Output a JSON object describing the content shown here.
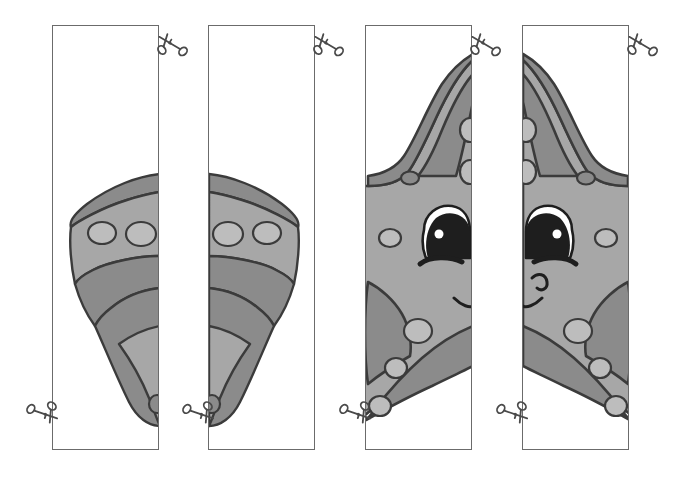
{
  "worksheet": {
    "title": "Starfish cut-and-match strips worksheet",
    "page_background": "#ffffff",
    "panel_count": 4,
    "panel_border_color": "#6b6b6b",
    "panel_fill": "#ffffff"
  },
  "colors": {
    "outline": "#3b3b3b",
    "body_light": "#a7a7a7",
    "body_dark": "#8b8b8b",
    "spot_light": "#bdbdbd",
    "eye_white": "#ffffff",
    "eye_dark": "#1e1e1e",
    "scissor": "#4a4a4a",
    "panel_border": "#6b6b6b"
  },
  "panels": [
    {
      "id": "panel-1",
      "name": "strip-1",
      "x": 52,
      "y": 25,
      "width": 107,
      "height": 425,
      "content": "starfish-arm-left-half",
      "scissors": [
        {
          "name": "scissors-top-right",
          "x": 155,
          "y": 28,
          "rotation": -18
        },
        {
          "name": "scissors-bottom-left",
          "x": 26,
          "y": 396,
          "rotation": 150
        }
      ]
    },
    {
      "id": "panel-2",
      "name": "strip-2",
      "x": 208,
      "y": 25,
      "width": 107,
      "height": 425,
      "content": "starfish-arm-right-half",
      "scissors": [
        {
          "name": "scissors-top-right",
          "x": 311,
          "y": 28,
          "rotation": -18
        },
        {
          "name": "scissors-bottom-left",
          "x": 182,
          "y": 396,
          "rotation": 150
        }
      ]
    },
    {
      "id": "panel-3",
      "name": "strip-3",
      "x": 365,
      "y": 25,
      "width": 107,
      "height": 425,
      "content": "starfish-face-left-half",
      "scissors": [
        {
          "name": "scissors-top-right",
          "x": 468,
          "y": 28,
          "rotation": -18
        },
        {
          "name": "scissors-bottom-left",
          "x": 339,
          "y": 396,
          "rotation": 150
        }
      ]
    },
    {
      "id": "panel-4",
      "name": "strip-4",
      "x": 522,
      "y": 25,
      "width": 107,
      "height": 425,
      "content": "starfish-face-right-half",
      "scissors": [
        {
          "name": "scissors-top-right",
          "x": 625,
          "y": 28,
          "rotation": -18
        },
        {
          "name": "scissors-bottom-left",
          "x": 496,
          "y": 396,
          "rotation": 150
        }
      ]
    }
  ],
  "artwork": {
    "subject": "cartoon starfish",
    "description": "A smiling cartoon starfish drawn in two gray tones with light oval spots, split vertically across paired strips.",
    "features": [
      "eye",
      "eyebrow",
      "smile",
      "spots",
      "arms"
    ]
  },
  "icons": {
    "scissors": "scissors-icon"
  }
}
